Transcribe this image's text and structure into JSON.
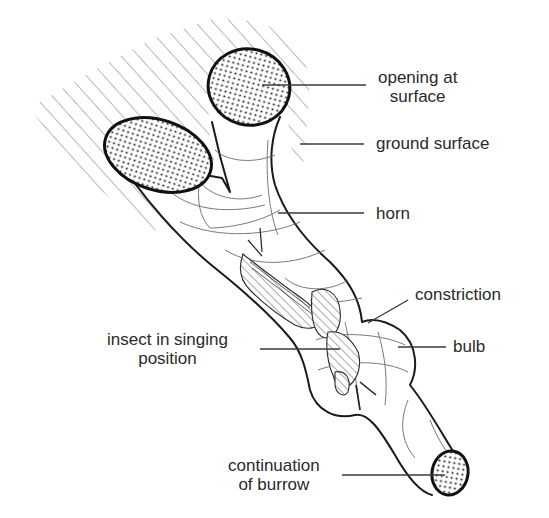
{
  "figure": {
    "colors": {
      "ink": "#1a1a1a",
      "label_text": "#2a2a2a",
      "hatch": "#8a8a8a",
      "background": "#ffffff"
    }
  },
  "labels": {
    "opening": {
      "line1": "opening at",
      "line2": "surface"
    },
    "ground": {
      "text": "ground surface"
    },
    "horn": {
      "text": "horn"
    },
    "constriction": {
      "text": "constriction"
    },
    "bulb": {
      "text": "bulb"
    },
    "insect": {
      "line1": "insect in singing",
      "line2": "position"
    },
    "continuation": {
      "line1": "continuation",
      "line2": "of burrow"
    }
  },
  "icons": {
    "ground_hatch": "diagonal-hatch-pattern",
    "openings": "dotted-stipple-ellipse"
  }
}
